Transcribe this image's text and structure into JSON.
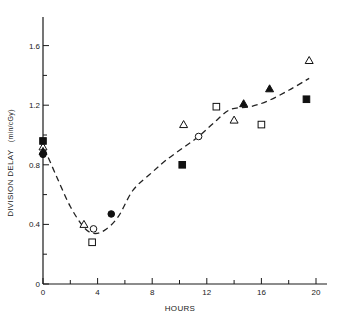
{
  "chart_data": {
    "type": "scatter",
    "title": "",
    "xlabel": "HOURS",
    "ylabel": "DIVISION DELAY",
    "ylabel_units": "(min/cGy)",
    "xlim": [
      0,
      20
    ],
    "ylim": [
      0,
      1.8
    ],
    "x_ticks": [
      0,
      4,
      8,
      12,
      16,
      20
    ],
    "x_minor_ticks": [
      2,
      6,
      10,
      14,
      18
    ],
    "y_ticks": [
      0,
      0.4,
      0.8,
      1.2,
      1.6
    ],
    "y_tick_labels": [
      "0",
      "0.4",
      "0.8",
      "1.2",
      "1.6"
    ],
    "y_minor_ticks": [
      0.2,
      0.6,
      1.0,
      1.4
    ],
    "grid": false,
    "legend": null,
    "series": [
      {
        "name": "open-triangle",
        "marker": "triangle-open",
        "points": [
          [
            0,
            0.92
          ],
          [
            3.0,
            0.4
          ],
          [
            10.3,
            1.07
          ],
          [
            14.0,
            1.1
          ],
          [
            19.5,
            1.5
          ]
        ]
      },
      {
        "name": "filled-triangle",
        "marker": "triangle-filled",
        "points": [
          [
            0,
            0.89
          ],
          [
            14.7,
            1.21
          ],
          [
            16.6,
            1.31
          ]
        ]
      },
      {
        "name": "open-circle",
        "marker": "circle-open",
        "points": [
          [
            3.7,
            0.37
          ],
          [
            11.4,
            0.99
          ]
        ]
      },
      {
        "name": "filled-circle",
        "marker": "circle-filled",
        "points": [
          [
            0,
            0.87
          ],
          [
            5.0,
            0.47
          ]
        ]
      },
      {
        "name": "open-square",
        "marker": "square-open",
        "points": [
          [
            3.6,
            0.28
          ],
          [
            12.7,
            1.19
          ],
          [
            16.0,
            1.07
          ]
        ]
      },
      {
        "name": "filled-square",
        "marker": "square-filled",
        "points": [
          [
            0,
            0.96
          ],
          [
            10.2,
            0.8
          ],
          [
            19.3,
            1.24
          ]
        ]
      }
    ],
    "fit_curve": {
      "style": "dashed",
      "points": [
        [
          0.1,
          0.91
        ],
        [
          1.0,
          0.72
        ],
        [
          2.0,
          0.52
        ],
        [
          3.0,
          0.38
        ],
        [
          3.7,
          0.34
        ],
        [
          4.5,
          0.36
        ],
        [
          5.5,
          0.45
        ],
        [
          6.6,
          0.63
        ],
        [
          8.0,
          0.75
        ],
        [
          9.0,
          0.83
        ],
        [
          10.2,
          0.91
        ],
        [
          11.4,
          0.99
        ],
        [
          12.5,
          1.08
        ],
        [
          13.7,
          1.17
        ],
        [
          15.2,
          1.19
        ],
        [
          16.5,
          1.23
        ],
        [
          18.0,
          1.3
        ],
        [
          19.5,
          1.38
        ]
      ]
    }
  }
}
